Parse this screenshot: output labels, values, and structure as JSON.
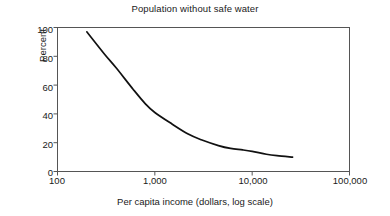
{
  "chart_data": {
    "type": "line",
    "title": "Population without safe water",
    "xlabel": "Per capita income (dollars, log scale)",
    "ylabel": "Percent",
    "xscale": "log",
    "xlim": [
      100,
      100000
    ],
    "ylim": [
      0,
      100
    ],
    "grid": false,
    "legend": null,
    "xticks": [
      100,
      1000,
      10000,
      100000
    ],
    "xtick_labels": [
      "100",
      "1,000",
      "10,000",
      "100,000"
    ],
    "yticks": [
      0,
      20,
      40,
      60,
      80,
      100
    ],
    "ytick_labels": [
      "0",
      "20",
      "40",
      "60",
      "80",
      "100"
    ],
    "line_color": "#111111",
    "frame_color": "#555555",
    "background": "#ffffff",
    "series": [
      {
        "name": "Population without safe water",
        "x": [
          200,
          300,
          400,
          600,
          800,
          1000,
          1500,
          2200,
          3000,
          4500,
          6000,
          8000,
          10000,
          14000,
          18000,
          26000
        ],
        "y": [
          97,
          82,
          72,
          57,
          47,
          41,
          33,
          26,
          22,
          18,
          16,
          15,
          14,
          12,
          11,
          10
        ]
      }
    ]
  }
}
